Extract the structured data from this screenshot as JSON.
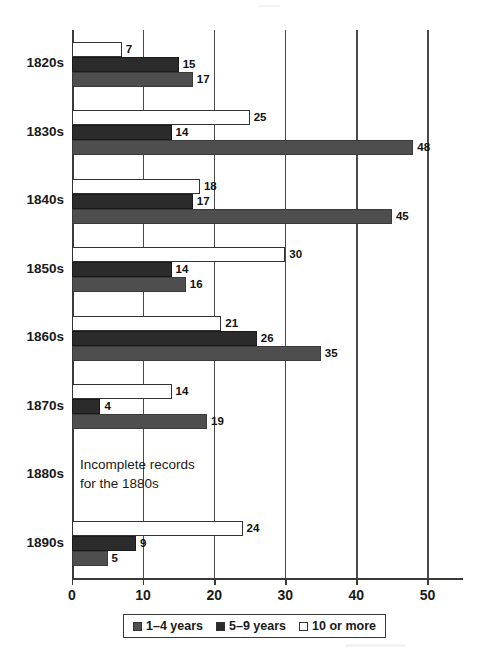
{
  "chart_data": {
    "type": "bar",
    "orientation": "horizontal",
    "title": "",
    "xlabel": "",
    "ylabel": "",
    "xlim": [
      0,
      55
    ],
    "xticks": [
      0,
      10,
      20,
      30,
      40,
      50
    ],
    "xtick_labels": [
      "0",
      "10",
      "20",
      "30",
      "40",
      "50"
    ],
    "grid": true,
    "grid_axis": "x",
    "legend_position": "bottom",
    "categories": [
      "1820s",
      "1830s",
      "1840s",
      "1850s",
      "1860s",
      "1870s",
      "1880s",
      "1890s"
    ],
    "series": [
      {
        "name": "1–4 years",
        "color": "#4e4e4e",
        "values": [
          17,
          48,
          45,
          16,
          35,
          19,
          null,
          5
        ],
        "labels": [
          "17",
          "48",
          "45",
          "16",
          "35",
          "19",
          "",
          "5"
        ]
      },
      {
        "name": "5–9 years",
        "color": "#2b2b2b",
        "values": [
          15,
          14,
          17,
          14,
          26,
          4,
          null,
          9
        ],
        "labels": [
          "15",
          "14",
          "17",
          "14",
          "26",
          "4",
          "",
          "9"
        ]
      },
      {
        "name": "10 or more",
        "color": "#ffffff",
        "values": [
          7,
          25,
          18,
          30,
          21,
          14,
          null,
          24
        ],
        "labels": [
          "7",
          "25",
          "18",
          "30",
          "21",
          "14",
          "",
          "24"
        ]
      }
    ],
    "series_draw_order_top_to_bottom": [
      "10 or more",
      "5–9 years",
      "1–4 years"
    ],
    "annotations": [
      {
        "text": "Incomplete records\nfor the 1880s",
        "category": "1880s"
      }
    ]
  },
  "legend": {
    "items": [
      {
        "label": "1–4 years",
        "swatch": "#4e4e4e"
      },
      {
        "label": "5–9 years",
        "swatch": "#2b2b2b"
      },
      {
        "label": "10 or more",
        "swatch": "#ffffff"
      }
    ]
  },
  "colors": {
    "axis": "#3a3a3a",
    "grid": "#4a4a4a",
    "text": "#1a1a1a",
    "background": "#ffffff"
  }
}
